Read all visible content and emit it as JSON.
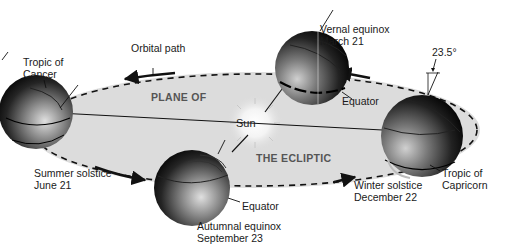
{
  "diagram": {
    "plane_label_top": "PLANE OF",
    "plane_label_bottom": "THE ECLIPTIC",
    "sun_label": "Sun",
    "orbital_path_label": "Orbital path",
    "tilt_label": "23.5°",
    "positions": [
      {
        "id": "summer",
        "name": "Summer solstice",
        "date": "June 21"
      },
      {
        "id": "vernal",
        "name": "Vernal equinox",
        "date": "March 21"
      },
      {
        "id": "autumnal",
        "name": "Autumnal equinox",
        "date": "September 23"
      },
      {
        "id": "winter",
        "name": "Winter solstice",
        "date": "December 22"
      }
    ],
    "callouts": {
      "tropic_cancer_line1": "Tropic of",
      "tropic_cancer_line2": "Cancer",
      "tropic_capricorn_line1": "Tropic of",
      "tropic_capricorn_line2": "Capricorn",
      "equator_vernal": "Equator",
      "equator_autumnal": "Equator"
    },
    "colors": {
      "plane_fill": "#dcdcdc",
      "orbit_line": "#111111",
      "earth_dark": "#0a0a0a",
      "earth_light": "#d8d8d8"
    }
  }
}
